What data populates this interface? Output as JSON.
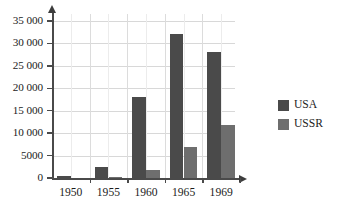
{
  "chart_data": {
    "type": "bar",
    "title": "",
    "subtitle": "",
    "xlabel": "",
    "ylabel": "",
    "categories": [
      "1950",
      "1955",
      "1960",
      "1965",
      "1969"
    ],
    "series": [
      {
        "name": "USA",
        "color": "#4a4a4a",
        "values": [
          450,
          2350,
          18100,
          32200,
          28100
        ]
      },
      {
        "name": "USSR",
        "color": "#6e6e6e",
        "values": [
          0,
          250,
          1800,
          7000,
          11800
        ]
      }
    ],
    "ylim": [
      0,
      37000
    ],
    "yticks": [
      0,
      5000,
      10000,
      15000,
      20000,
      25000,
      30000,
      35000
    ],
    "ytick_labels": [
      "0",
      "5000",
      "10 000",
      "15 000",
      "20 000",
      "25 000",
      "30 000",
      "35 000"
    ],
    "grid": true,
    "grid_axis": "both",
    "legend_position": "right",
    "axis_arrows": true
  },
  "legend": {
    "entries": [
      {
        "label": "USA",
        "swatch_color": "#4a4a4a"
      },
      {
        "label": "USSR",
        "swatch_color": "#6e6e6e"
      }
    ]
  },
  "caption": {
    "text": ""
  },
  "colors": {
    "usa": "#4a4a4a",
    "ussr": "#6e6e6e",
    "axis": "#4a4a4a",
    "grid": "#d8d8d8",
    "text": "#1c1c1c",
    "background": "#ffffff"
  }
}
